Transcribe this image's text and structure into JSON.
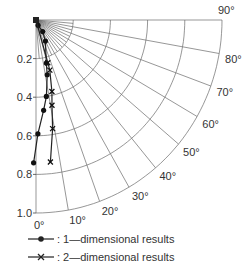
{
  "chart_data": {
    "type": "scatter",
    "subtype": "polar-quadrant",
    "title": "",
    "radial_axis": {
      "ticks": [
        0.2,
        0.4,
        0.6,
        0.8,
        1.0
      ],
      "tick_labels": [
        "0.2",
        "0.4",
        "0.6",
        "0.8",
        "1.0"
      ],
      "range": [
        0,
        1.0
      ],
      "direction": "downward from origin"
    },
    "angular_axis": {
      "ticks_deg": [
        0,
        10,
        20,
        30,
        40,
        50,
        60,
        70,
        80,
        90
      ],
      "tick_labels": [
        "0°",
        "10°",
        "20°",
        "30°",
        "40°",
        "50°",
        "60°",
        "70°",
        "80°",
        "90°"
      ],
      "range_deg": [
        0,
        90
      ]
    },
    "grid": true,
    "legend_position": "bottom",
    "series": [
      {
        "name": "1-dimensional results",
        "marker": "dot",
        "points": [
          {
            "r": 0.03,
            "theta_deg": 22
          },
          {
            "r": 0.07,
            "theta_deg": 31
          },
          {
            "r": 0.12,
            "theta_deg": 25
          },
          {
            "r": 0.23,
            "theta_deg": 14
          },
          {
            "r": 0.29,
            "theta_deg": 12
          },
          {
            "r": 0.4,
            "theta_deg": 8
          },
          {
            "r": 0.47,
            "theta_deg": 5
          },
          {
            "r": 0.59,
            "theta_deg": 1
          },
          {
            "r": 0.74,
            "theta_deg": -1
          }
        ]
      },
      {
        "name": "2-dimensional results",
        "marker": "x",
        "points": [
          {
            "r": 0.23,
            "theta_deg": 16
          },
          {
            "r": 0.27,
            "theta_deg": 16
          },
          {
            "r": 0.38,
            "theta_deg": 13
          },
          {
            "r": 0.45,
            "theta_deg": 11
          },
          {
            "r": 0.57,
            "theta_deg": 9
          },
          {
            "r": 0.74,
            "theta_deg": 6
          }
        ]
      }
    ]
  },
  "legend": {
    "items": [
      {
        "label": ": 1—dimensional results",
        "marker": "dot"
      },
      {
        "label": ": 2—dimensional results",
        "marker": "x"
      }
    ]
  }
}
